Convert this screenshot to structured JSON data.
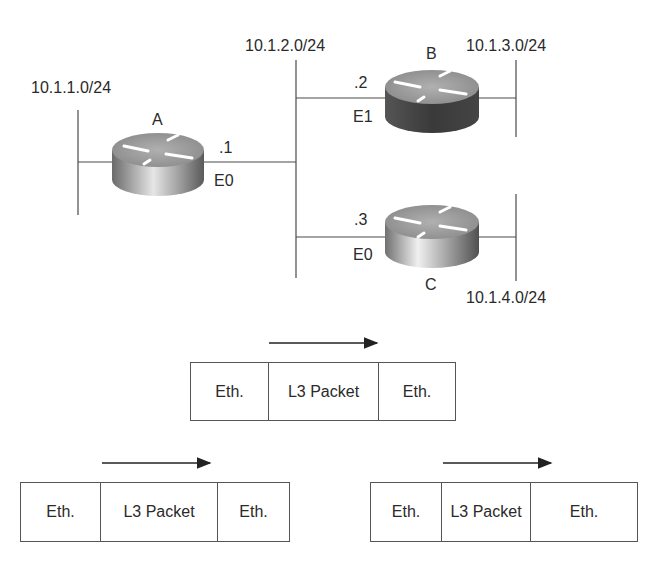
{
  "networks": {
    "lan_a": "10.1.1.0/24",
    "lan_ab_c": "10.1.2.0/24",
    "lan_b": "10.1.3.0/24",
    "lan_c": "10.1.4.0/24"
  },
  "routers": [
    {
      "name": "A",
      "interface": "E0",
      "host": ".1"
    },
    {
      "name": "B",
      "interface": "E1",
      "host": ".2"
    },
    {
      "name": "C",
      "interface": "E0",
      "host": ".3"
    }
  ],
  "frames": [
    {
      "id": "middle",
      "cells": [
        "Eth.",
        "L3 Packet",
        "Eth."
      ]
    },
    {
      "id": "left",
      "cells": [
        "Eth.",
        "L3 Packet",
        "Eth."
      ]
    },
    {
      "id": "right",
      "cells": [
        "Eth.",
        "L3 Packet",
        "Eth."
      ]
    }
  ],
  "colors": {
    "line": "#4a4a4a",
    "router_top": "#9a9a9a",
    "router_side_light": "#d8d8d8",
    "router_side_dark": "#4a4a4a"
  }
}
